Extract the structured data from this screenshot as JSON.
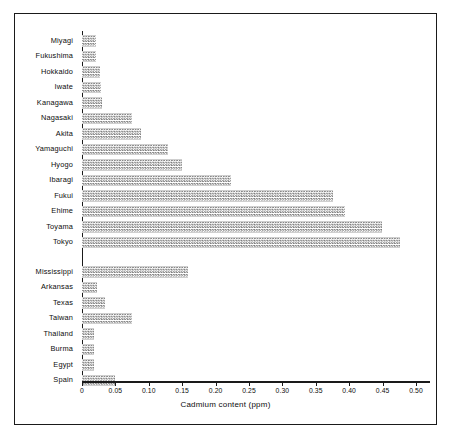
{
  "chart_data": {
    "type": "bar",
    "orientation": "horizontal",
    "title": "",
    "xlabel": "Cadmium content  (ppm)",
    "ylabel": "",
    "xlim": [
      0,
      0.52
    ],
    "grid": false,
    "legend": false,
    "tick_labels": [
      "0",
      "0.05",
      "0.10",
      "0.15",
      "0.20",
      "0.25",
      "0.30",
      "0.35",
      "0.40",
      "0.45",
      "0.50"
    ],
    "tick_values": [
      0,
      0.05,
      0.1,
      0.15,
      0.2,
      0.25,
      0.3,
      0.35,
      0.4,
      0.45,
      0.5
    ],
    "groups": [
      {
        "name": "japan",
        "categories": [
          "Miyagi",
          "Fukushima",
          "Hokkaido",
          "Iwate",
          "Kanagawa",
          "Nagasaki",
          "Akita",
          "Yamaguchi",
          "Hyogo",
          "Ibaragi",
          "Fukui",
          "Ehime",
          "Toyama",
          "Tokyo"
        ],
        "values": [
          0.021,
          0.021,
          0.027,
          0.028,
          0.03,
          0.075,
          0.088,
          0.128,
          0.15,
          0.223,
          0.376,
          0.394,
          0.449,
          0.476
        ]
      },
      {
        "name": "other",
        "categories": [
          "Mississippi",
          "Arkansas",
          "Texas",
          "Taiwan",
          "Thailand",
          "Burma",
          "Egypt",
          "Spain"
        ],
        "values": [
          0.158,
          0.022,
          0.035,
          0.075,
          0.018,
          0.018,
          0.018,
          0.05
        ]
      }
    ],
    "categories": [
      "Miyagi",
      "Fukushima",
      "Hokkaido",
      "Iwate",
      "Kanagawa",
      "Nagasaki",
      "Akita",
      "Yamaguchi",
      "Hyogo",
      "Ibaragi",
      "Fukui",
      "Ehime",
      "Toyama",
      "Tokyo",
      "Mississippi",
      "Arkansas",
      "Texas",
      "Taiwan",
      "Thailand",
      "Burma",
      "Egypt",
      "Spain"
    ],
    "values": [
      0.021,
      0.021,
      0.027,
      0.028,
      0.03,
      0.075,
      0.088,
      0.128,
      0.15,
      0.223,
      0.376,
      0.394,
      0.449,
      0.476,
      0.158,
      0.022,
      0.035,
      0.075,
      0.018,
      0.018,
      0.018,
      0.05
    ],
    "colors": {
      "bar_fill": "#7d7d7d",
      "axis": "#1a1a1a",
      "text": "#0d0d0d",
      "background": "#ffffff"
    }
  }
}
